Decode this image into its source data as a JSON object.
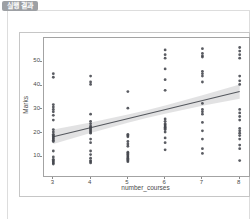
{
  "page": {
    "badge_label": "실행 결과"
  },
  "chart_data": {
    "type": "scatter",
    "title": "",
    "xlabel": "number_courses",
    "ylabel": "Marks",
    "xlim": [
      2.75,
      8.25
    ],
    "ylim": [
      2,
      60
    ],
    "x_ticks": [
      3,
      4,
      5,
      6,
      7,
      8
    ],
    "y_ticks": [
      10,
      20,
      30,
      40,
      50
    ],
    "grid": false,
    "legend": "none",
    "colors": {
      "point": "#43464c",
      "regression_line": "#54575d",
      "confidence_band": "#98989c",
      "spine": "#a3a3a3",
      "tick_text": "#4a4a4a"
    },
    "regression_line": {
      "x": [
        3,
        8
      ],
      "y": [
        18.5,
        37.5
      ]
    },
    "confidence_band": {
      "x": [
        3,
        4,
        5,
        5.5,
        6,
        7,
        8
      ],
      "upper": [
        21.5,
        24.5,
        27.8,
        29.6,
        31.6,
        35.9,
        40.5
      ],
      "lower": [
        15.5,
        20.1,
        24.4,
        26.4,
        28.2,
        31.5,
        34.5
      ]
    },
    "points_by_course": [
      {
        "number_courses": 3,
        "marks": [
          45,
          43.5,
          32,
          31,
          30,
          29,
          27.5,
          25.5,
          21.5,
          20.5,
          19.5,
          19,
          18.5,
          18,
          17.5,
          17,
          16.5,
          12.5,
          10,
          9,
          8.5,
          8,
          7.5,
          7
        ]
      },
      {
        "number_courses": 4,
        "marks": [
          44,
          41.5,
          40.5,
          28,
          25,
          24,
          23,
          22.5,
          22,
          21.5,
          21,
          20.5,
          20,
          17.5,
          16,
          12.5,
          11,
          9.5,
          8.5,
          8,
          7.5
        ]
      },
      {
        "number_courses": 5,
        "marks": [
          37.5,
          30.5,
          19.5,
          19,
          18.5,
          16.5,
          15.5,
          14.5,
          12,
          11.5,
          11,
          10.5,
          10,
          9.5,
          9,
          8.5,
          8
        ]
      },
      {
        "number_courses": 6,
        "marks": [
          55,
          53,
          51.5,
          47,
          42.5,
          38,
          26,
          25,
          24,
          23.5,
          23,
          22.5,
          22,
          21.5,
          20.5,
          18,
          16,
          13
        ]
      },
      {
        "number_courses": 7,
        "marks": [
          55.5,
          53.5,
          52.5,
          52,
          46,
          45,
          44,
          41.5,
          32.5,
          30,
          29,
          28,
          24.5,
          21,
          17.5,
          13.5,
          11.5
        ]
      },
      {
        "number_courses": 8,
        "marks": [
          56,
          54.5,
          53,
          51.5,
          44,
          42,
          40.5,
          30,
          28.5,
          27,
          25.5,
          22,
          21,
          20,
          19,
          17.5,
          15,
          13.5,
          8.5
        ]
      }
    ]
  }
}
